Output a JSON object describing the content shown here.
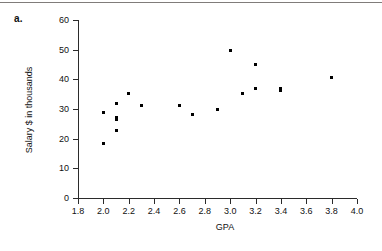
{
  "figure": {
    "part_label": "a."
  },
  "chart_data": {
    "type": "scatter",
    "title": "",
    "xlabel": "GPA",
    "ylabel": "Salary $ in thousands",
    "xlim": [
      1.8,
      4.0
    ],
    "ylim": [
      0,
      60
    ],
    "xticks": [
      "1.8",
      "2.0",
      "2.2",
      "2.4",
      "2.6",
      "2.8",
      "3.0",
      "3.2",
      "3.4",
      "3.6",
      "3.8",
      "4.0"
    ],
    "xtick_values": [
      1.8,
      2.0,
      2.2,
      2.4,
      2.6,
      2.8,
      3.0,
      3.2,
      3.4,
      3.6,
      3.8,
      4.0
    ],
    "yticks": [
      "0",
      "10",
      "20",
      "30",
      "40",
      "50",
      "60"
    ],
    "ytick_values": [
      0,
      10,
      20,
      30,
      40,
      50,
      60
    ],
    "grid": false,
    "legend": null,
    "marker_color": "#000000",
    "points": [
      {
        "x": 2.0,
        "y": 28.8
      },
      {
        "x": 2.0,
        "y": 18.5
      },
      {
        "x": 2.1,
        "y": 32.0
      },
      {
        "x": 2.1,
        "y": 27.0
      },
      {
        "x": 2.1,
        "y": 26.4
      },
      {
        "x": 2.1,
        "y": 22.8
      },
      {
        "x": 2.2,
        "y": 35.2
      },
      {
        "x": 2.3,
        "y": 31.3
      },
      {
        "x": 2.6,
        "y": 31.2
      },
      {
        "x": 2.7,
        "y": 28.2
      },
      {
        "x": 2.9,
        "y": 30.0
      },
      {
        "x": 3.0,
        "y": 49.8
      },
      {
        "x": 3.1,
        "y": 35.1
      },
      {
        "x": 3.2,
        "y": 45.0
      },
      {
        "x": 3.2,
        "y": 36.9
      },
      {
        "x": 3.4,
        "y": 37.0
      },
      {
        "x": 3.4,
        "y": 36.3
      },
      {
        "x": 3.8,
        "y": 40.7
      }
    ]
  }
}
